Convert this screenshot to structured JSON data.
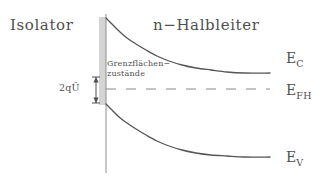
{
  "figure": {
    "regions": {
      "left_label": "Isolator",
      "right_label": "n−Halbleiter"
    },
    "energy_levels": {
      "conduction": {
        "symbol": "E",
        "subscript": "C"
      },
      "fermi": {
        "symbol": "E",
        "subscript": "FH"
      },
      "valence": {
        "symbol": "E",
        "subscript": "V"
      }
    },
    "annotations": {
      "interface_states_line1": "Grenzflächen−",
      "interface_states_line2": "zustände",
      "band_bending": "2qŨ"
    },
    "colors": {
      "ink": "#4f4f4f",
      "curve": "#555555",
      "background": "#ffffff"
    }
  },
  "chart_data": {
    "type": "line",
    "title": "",
    "xlabel": "",
    "ylabel": "",
    "xlim": [
      106,
      270
    ],
    "ylim": [
      18,
      175
    ],
    "grid": false,
    "legend": "right",
    "annotations": [
      {
        "text": "Isolator",
        "x": 10,
        "y": 18,
        "role": "region-name"
      },
      {
        "text": "n−Halbleiter",
        "x": 153,
        "y": 18,
        "role": "region-name"
      },
      {
        "text": "Grenzflächen− zustände",
        "x": 107,
        "y": 59,
        "role": "interface-states-callout"
      },
      {
        "text": "2qŨ",
        "x": 59,
        "y": 83,
        "role": "band-bending-measure"
      }
    ],
    "interface_x": 106,
    "fermi_level_y": 89,
    "band_bending_arrow": {
      "x": 96,
      "y_top": 77,
      "y_bottom": 103
    },
    "hatching": {
      "x": 106,
      "y_top": 18,
      "y_bottom": 105,
      "side": "left"
    },
    "series": [
      {
        "name": "E_C",
        "style": "solid",
        "points": [
          [
            106,
            18
          ],
          [
            112,
            24
          ],
          [
            119,
            31
          ],
          [
            127,
            38
          ],
          [
            136,
            44
          ],
          [
            146,
            50
          ],
          [
            157,
            56
          ],
          [
            169,
            61
          ],
          [
            182,
            65
          ],
          [
            196,
            68
          ],
          [
            211,
            70
          ],
          [
            227,
            72
          ],
          [
            244,
            73
          ],
          [
            270,
            73
          ]
        ]
      },
      {
        "name": "E_FH",
        "style": "dashed",
        "points": [
          [
            106,
            89
          ],
          [
            270,
            89
          ]
        ]
      },
      {
        "name": "E_V",
        "style": "solid",
        "points": [
          [
            106,
            104
          ],
          [
            112,
            110
          ],
          [
            119,
            117
          ],
          [
            127,
            123
          ],
          [
            136,
            129
          ],
          [
            146,
            135
          ],
          [
            157,
            141
          ],
          [
            169,
            146
          ],
          [
            182,
            150
          ],
          [
            196,
            153
          ],
          [
            211,
            155
          ],
          [
            227,
            156
          ],
          [
            244,
            157
          ],
          [
            270,
            157
          ]
        ]
      }
    ]
  }
}
